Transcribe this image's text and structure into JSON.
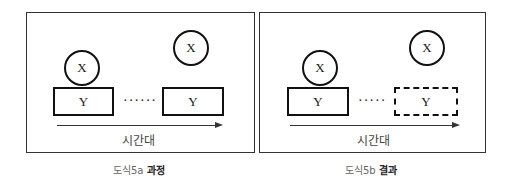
{
  "figures": [
    {
      "id": "a",
      "caption_prefix": "도식5a",
      "caption_title": "과정",
      "circle_left_label": "X",
      "circle_right_label": "X",
      "rect_left_label": "Y",
      "rect_right_label": "Y",
      "rect_right_style": "solid",
      "ellipsis": "······",
      "axis_label": "시간대"
    },
    {
      "id": "b",
      "caption_prefix": "도식5b",
      "caption_title": "결과",
      "circle_left_label": "X",
      "circle_right_label": "X",
      "rect_left_label": "Y",
      "rect_right_label": "Y",
      "rect_right_style": "dashed",
      "ellipsis": "·····",
      "axis_label": "시간대"
    }
  ],
  "colors": {
    "stroke": "#111111",
    "frame": "#333333",
    "caption": "#666666"
  }
}
